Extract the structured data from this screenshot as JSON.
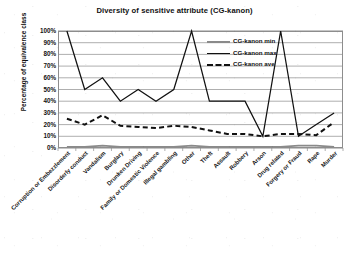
{
  "chart_data": {
    "type": "line",
    "title": "Diversity of sensitive attribute (CG-kanon)",
    "xlabel": "",
    "ylabel": "Percentage of equivalence class",
    "ylim": [
      0,
      100
    ],
    "ytick_labels": [
      "100%",
      "90%",
      "80%",
      "70%",
      "60%",
      "50%",
      "40%",
      "30%",
      "20%",
      "10%",
      "0%"
    ],
    "ytick_values": [
      100,
      90,
      80,
      70,
      60,
      50,
      40,
      30,
      20,
      10,
      0
    ],
    "grid": true,
    "legend_position": "upper-right-inside",
    "categories": [
      "Corruption or Embezzlement",
      "Disorderly conduct",
      "Vandalism",
      "Burglary",
      "Drunken Driving",
      "Family or Domestic Violence",
      "Illegal gambling",
      "Other",
      "Theft",
      "Assault",
      "Robbery",
      "Arson",
      "Drug related",
      "Forgery or Fraud",
      "Rape",
      "Murder"
    ],
    "series": [
      {
        "name": "CG-kanon min",
        "style": "solid-thick-gray",
        "color": "#8a8a8a",
        "values": [
          1,
          1,
          2,
          1,
          1,
          1,
          1,
          2,
          1,
          1,
          1,
          1,
          1,
          2,
          2,
          1
        ]
      },
      {
        "name": "CG-kanon max",
        "style": "solid-thin-black",
        "color": "#111111",
        "values": [
          100,
          50,
          60,
          40,
          50,
          40,
          50,
          100,
          40,
          40,
          40,
          10,
          100,
          10,
          20,
          30
        ]
      },
      {
        "name": "CG-kanon ave",
        "style": "dashed-black",
        "color": "#111111",
        "values": [
          25,
          20,
          28,
          19,
          18,
          17,
          19,
          18,
          15,
          12,
          12,
          10,
          12,
          12,
          11,
          22
        ]
      }
    ]
  }
}
